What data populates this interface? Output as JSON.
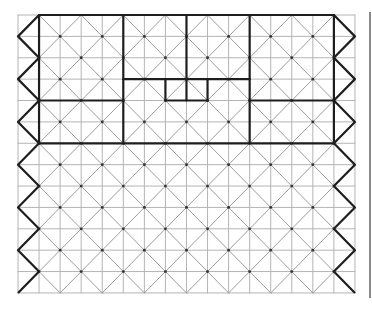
{
  "diagram": {
    "type": "tiling-grid",
    "grid": {
      "cols": 16,
      "rows": 13,
      "origin_px": [
        18,
        15
      ],
      "cell_w_px": 21.06,
      "cell_h_px": 21.38
    },
    "colors": {
      "background": "#ffffff",
      "grid_line": "#b4b4b4",
      "diagonal_line": "#9c9c9c",
      "bold_line": "#1e1e1e",
      "vertex_dot": "#333333",
      "separator": "#8a8a8a"
    },
    "diagonal_pattern": "diamonds with vertices at lattice points where col+row is odd",
    "bold_segments": [
      {
        "name": "top-edge",
        "points": [
          [
            1,
            0
          ],
          [
            15,
            0
          ]
        ]
      },
      {
        "name": "col1",
        "points": [
          [
            1,
            0
          ],
          [
            1,
            6
          ]
        ]
      },
      {
        "name": "col5",
        "points": [
          [
            5,
            0
          ],
          [
            5,
            6
          ]
        ]
      },
      {
        "name": "col8",
        "points": [
          [
            8,
            0
          ],
          [
            8,
            4
          ]
        ]
      },
      {
        "name": "col11",
        "points": [
          [
            11,
            0
          ],
          [
            11,
            6
          ]
        ]
      },
      {
        "name": "col15",
        "points": [
          [
            15,
            0
          ],
          [
            15,
            6
          ]
        ]
      },
      {
        "name": "row3-mid",
        "points": [
          [
            5,
            3
          ],
          [
            11,
            3
          ]
        ]
      },
      {
        "name": "row4-left",
        "points": [
          [
            1,
            4
          ],
          [
            5,
            4
          ]
        ]
      },
      {
        "name": "row4-mid",
        "points": [
          [
            7,
            4
          ],
          [
            9,
            4
          ]
        ]
      },
      {
        "name": "row4-right",
        "points": [
          [
            11,
            4
          ],
          [
            15,
            4
          ]
        ]
      },
      {
        "name": "col7-short",
        "points": [
          [
            7,
            3
          ],
          [
            7,
            4
          ]
        ]
      },
      {
        "name": "col9-short",
        "points": [
          [
            9,
            3
          ],
          [
            9,
            4
          ]
        ]
      },
      {
        "name": "row6",
        "points": [
          [
            1,
            6
          ],
          [
            15,
            6
          ]
        ]
      }
    ],
    "zigzags": [
      {
        "name": "left-zigzag",
        "x_values": [
          1,
          0
        ],
        "start_row": 0,
        "end_row": 13
      },
      {
        "name": "right-zigzag",
        "x_values": [
          15,
          16
        ],
        "start_row": 0,
        "end_row": 13
      }
    ]
  }
}
